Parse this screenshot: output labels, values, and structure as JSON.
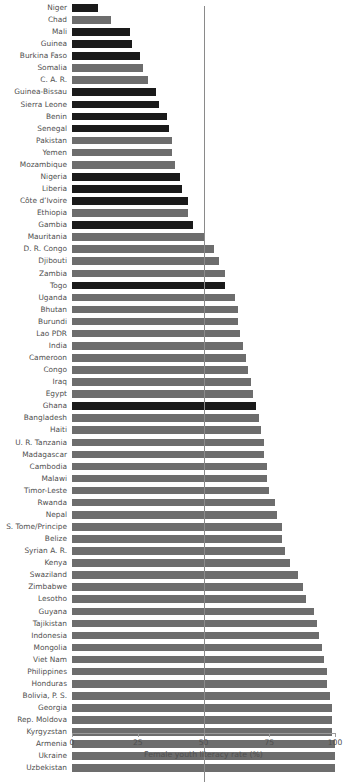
{
  "chart_data": {
    "type": "bar",
    "orientation": "horizontal",
    "title": "",
    "xlabel": "Female youth literacy rate (%)",
    "ylabel": "",
    "xlim": [
      0,
      100
    ],
    "xticks": [
      0,
      25,
      50,
      75,
      100
    ],
    "xtick_labels": [
      "0",
      "25",
      "50",
      "75",
      "100"
    ],
    "grid": false,
    "legend": "none",
    "annotations": [
      {
        "type": "reference-line",
        "axis": "x",
        "value": 50
      }
    ],
    "colors": {
      "dark": "#1a1a1a",
      "gray": "#6d6d6d",
      "reference_line": "#8a8a8a",
      "axis": "#9b9b9b",
      "text": "#4f4f4f",
      "background": "#ffffff"
    },
    "categories": [
      "Niger",
      "Chad",
      "Mali",
      "Guinea",
      "Burkina Faso",
      "Somalia",
      "C. A. R.",
      "Guinea-Bissau",
      "Sierra Leone",
      "Benin",
      "Senegal",
      "Pakistan",
      "Yemen",
      "Mozambique",
      "Nigeria",
      "Liberia",
      "Côte d’Ivoire",
      "Ethiopia",
      "Gambia",
      "Mauritania",
      "D. R. Congo",
      "Djibouti",
      "Zambia",
      "Togo",
      "Uganda",
      "Bhutan",
      "Burundi",
      "Lao PDR",
      "India",
      "Cameroon",
      "Congo",
      "Iraq",
      "Egypt",
      "Ghana",
      "Bangladesh",
      "Haiti",
      "U. R. Tanzania",
      "Madagascar",
      "Cambodia",
      "Malawi",
      "Timor-Leste",
      "Rwanda",
      "Nepal",
      "S. Tome/Principe",
      "Belize",
      "Syrian A. R.",
      "Kenya",
      "Swaziland",
      "Zimbabwe",
      "Lesotho",
      "Guyana",
      "Tajikistan",
      "Indonesia",
      "Mongolia",
      "Viet Nam",
      "Philippines",
      "Honduras",
      "Bolivia, P. S.",
      "Georgia",
      "Rep. Moldova",
      "Kyrgyzstan",
      "Armenia",
      "Ukraine",
      "Uzbekistan"
    ],
    "values": [
      10,
      15,
      22,
      23,
      26,
      27,
      29,
      32,
      33,
      36,
      37,
      38,
      38,
      39,
      41,
      42,
      44,
      44,
      46,
      50,
      54,
      56,
      58,
      58,
      62,
      63,
      63,
      64,
      65,
      66,
      67,
      68,
      69,
      70,
      71,
      72,
      73,
      73,
      74,
      74,
      75,
      77,
      78,
      80,
      80,
      81,
      83,
      86,
      88,
      89,
      92,
      93,
      94,
      95,
      96,
      97,
      97,
      98,
      99,
      99,
      99,
      100,
      100,
      100
    ],
    "series_group": [
      "dark",
      "gray",
      "dark",
      "dark",
      "dark",
      "gray",
      "gray",
      "dark",
      "dark",
      "dark",
      "dark",
      "gray",
      "gray",
      "gray",
      "dark",
      "dark",
      "dark",
      "gray",
      "dark",
      "gray",
      "gray",
      "gray",
      "gray",
      "dark",
      "gray",
      "gray",
      "gray",
      "gray",
      "gray",
      "gray",
      "gray",
      "gray",
      "gray",
      "dark",
      "gray",
      "gray",
      "gray",
      "gray",
      "gray",
      "gray",
      "gray",
      "gray",
      "gray",
      "gray",
      "gray",
      "gray",
      "gray",
      "gray",
      "gray",
      "gray",
      "gray",
      "gray",
      "gray",
      "gray",
      "gray",
      "gray",
      "gray",
      "gray",
      "gray",
      "gray",
      "gray",
      "gray",
      "gray",
      "gray"
    ]
  }
}
